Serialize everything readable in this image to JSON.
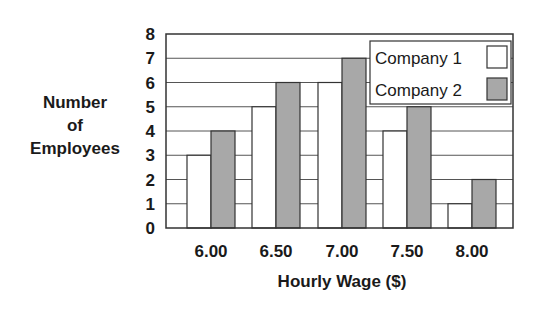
{
  "chart_data": {
    "type": "bar",
    "title": "",
    "xlabel": "Hourly Wage ($)",
    "ylabel": "Number of Employees",
    "ylabel_lines": [
      "Number",
      "of",
      "Employees"
    ],
    "categories": [
      "6.00",
      "6.50",
      "7.00",
      "7.50",
      "8.00"
    ],
    "series": [
      {
        "name": "Company 1",
        "values": [
          3,
          5,
          6,
          4,
          1
        ],
        "color": "#ffffff"
      },
      {
        "name": "Company 2",
        "values": [
          4,
          6,
          7,
          5,
          2
        ],
        "color": "#a8a8a8"
      }
    ],
    "ylim": [
      0,
      8
    ],
    "yticks": [
      "0",
      "1",
      "2",
      "3",
      "4",
      "5",
      "6",
      "7",
      "8"
    ],
    "grid": true,
    "legend_position": "upper right (inside plot)"
  },
  "colors": {
    "stroke": "#333333",
    "grid": "#555555",
    "company1_fill": "#ffffff",
    "company2_fill": "#a8a8a8"
  }
}
